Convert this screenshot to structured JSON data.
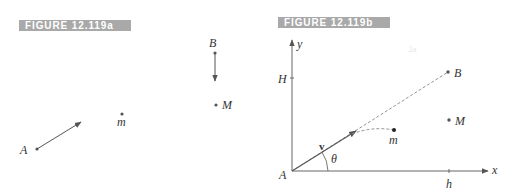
{
  "figure_a": {
    "title": "FIGURE 12.119a",
    "points": {
      "A": {
        "label": "A"
      },
      "B": {
        "label": "B"
      },
      "m": {
        "label": "m"
      },
      "M": {
        "label": "M"
      }
    }
  },
  "figure_b": {
    "title": "FIGURE 12.119b",
    "axes": {
      "x_label": "x",
      "y_label": "y"
    },
    "ticks": {
      "H": "H",
      "h": "h"
    },
    "points": {
      "A": {
        "label": "A"
      },
      "B": {
        "label": "B"
      },
      "m": {
        "label": "m"
      },
      "M": {
        "label": "M"
      }
    },
    "vector_label": "v",
    "angle_label": "θ",
    "ghost_text": "2a"
  },
  "colors": {
    "label_bg": "#a9a9a9",
    "label_text": "#ffffff",
    "line": "#555555",
    "dash": "#888888"
  }
}
